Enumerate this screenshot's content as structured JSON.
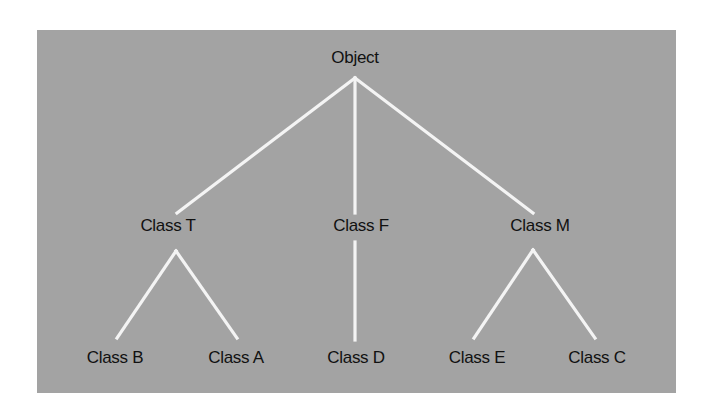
{
  "diagram": {
    "type": "class-hierarchy-tree",
    "colors": {
      "background": "#a3a3a3",
      "edge": "#f4f4f4",
      "text": "#111111"
    },
    "nodes": [
      {
        "id": "object",
        "label": "Object",
        "x": 355,
        "y": 48,
        "children": [
          "classT",
          "classF",
          "classM"
        ]
      },
      {
        "id": "classT",
        "label": "Class T",
        "x": 168,
        "y": 216,
        "children": [
          "classB",
          "classA"
        ]
      },
      {
        "id": "classF",
        "label": "Class F",
        "x": 361,
        "y": 216,
        "children": [
          "classD"
        ]
      },
      {
        "id": "classM",
        "label": "Class M",
        "x": 540,
        "y": 216,
        "children": [
          "classE",
          "classC"
        ]
      },
      {
        "id": "classB",
        "label": "Class B",
        "x": 115,
        "y": 348,
        "children": []
      },
      {
        "id": "classA",
        "label": "Class A",
        "x": 236,
        "y": 348,
        "children": []
      },
      {
        "id": "classD",
        "label": "Class D",
        "x": 356,
        "y": 348,
        "children": []
      },
      {
        "id": "classE",
        "label": "Class E",
        "x": 477,
        "y": 348,
        "children": []
      },
      {
        "id": "classC",
        "label": "Class C",
        "x": 597,
        "y": 348,
        "children": []
      }
    ],
    "edges": [
      {
        "from": "object",
        "to": "classT",
        "x1": 355,
        "y1": 78,
        "x2": 177,
        "y2": 213
      },
      {
        "from": "object",
        "to": "classF",
        "x1": 355,
        "y1": 78,
        "x2": 355,
        "y2": 213
      },
      {
        "from": "object",
        "to": "classM",
        "x1": 355,
        "y1": 78,
        "x2": 533,
        "y2": 213
      },
      {
        "from": "classT",
        "to": "classB",
        "x1": 176,
        "y1": 251,
        "x2": 117,
        "y2": 338
      },
      {
        "from": "classT",
        "to": "classA",
        "x1": 176,
        "y1": 251,
        "x2": 237,
        "y2": 338
      },
      {
        "from": "classF",
        "to": "classD",
        "x1": 355,
        "y1": 242,
        "x2": 355,
        "y2": 340
      },
      {
        "from": "classM",
        "to": "classE",
        "x1": 533,
        "y1": 250,
        "x2": 474,
        "y2": 338
      },
      {
        "from": "classM",
        "to": "classC",
        "x1": 533,
        "y1": 250,
        "x2": 595,
        "y2": 338
      }
    ]
  }
}
